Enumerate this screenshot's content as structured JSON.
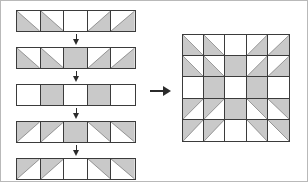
{
  "diagram": {
    "colors": {
      "patch_gray": "#c9c9c9",
      "background_white": "#ffffff",
      "seam_line": "#3b3b3b",
      "arrow": "#2b2b2b",
      "page_border": "#b9b9b9"
    },
    "grid": {
      "rows": 5,
      "columns": 5
    },
    "patch_types": {
      "empty": "white square",
      "full": "solid gray square",
      "tri_bl": "half-square triangle, gray in lower-left",
      "tri_br": "half-square triangle, gray in lower-right",
      "tri_tl": "half-square triangle, gray in upper-left",
      "tri_tr": "half-square triangle, gray in upper-right"
    },
    "strips": [
      {
        "name": "strip-1",
        "cells": [
          "tri_bl",
          "tri_bl",
          "empty",
          "tri_br",
          "tri_br"
        ]
      },
      {
        "name": "strip-2",
        "cells": [
          "tri_bl",
          "tri_bl",
          "full",
          "tri_br",
          "tri_br"
        ]
      },
      {
        "name": "strip-3",
        "cells": [
          "empty",
          "full",
          "empty",
          "full",
          "empty"
        ]
      },
      {
        "name": "strip-4",
        "cells": [
          "tri_tl",
          "tri_tl",
          "full",
          "tri_tr",
          "tri_tr"
        ]
      },
      {
        "name": "strip-5",
        "cells": [
          "tri_tl",
          "tri_tl",
          "empty",
          "tri_tr",
          "tri_tr"
        ]
      }
    ],
    "join_arrows": [
      {
        "name": "arrow-strip-1-to-2",
        "direction": "down"
      },
      {
        "name": "arrow-strip-2-to-3",
        "direction": "down"
      },
      {
        "name": "arrow-strip-3-to-4",
        "direction": "down"
      },
      {
        "name": "arrow-strip-4-to-5",
        "direction": "down"
      }
    ],
    "result_arrow": {
      "name": "arrow-to-result",
      "direction": "right"
    },
    "result_block": {
      "name": "assembled-quilt-block",
      "rows": [
        [
          "tri_bl",
          "tri_bl",
          "empty",
          "tri_br",
          "tri_br"
        ],
        [
          "tri_bl",
          "tri_bl",
          "full",
          "tri_br",
          "tri_br"
        ],
        [
          "empty",
          "full",
          "empty",
          "full",
          "empty"
        ],
        [
          "tri_tl",
          "tri_tl",
          "full",
          "tri_tr",
          "tri_tr"
        ],
        [
          "tri_tl",
          "tri_tl",
          "empty",
          "tri_tr",
          "tri_tr"
        ]
      ]
    }
  }
}
